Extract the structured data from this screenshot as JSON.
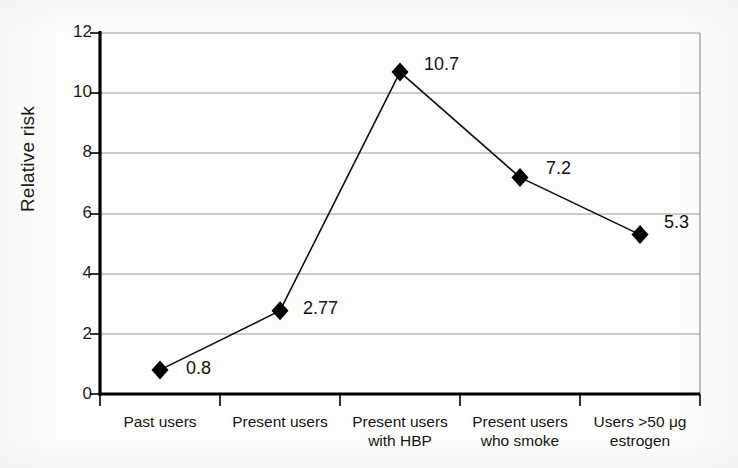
{
  "chart_data": {
    "type": "line",
    "title": "",
    "xlabel": "",
    "ylabel": "Relative risk",
    "categories": [
      "Past users",
      "Present users",
      "Present users\nwith HBP",
      "Present users\nwho smoke",
      "Users >50 μg\nestrogen"
    ],
    "category_lines": [
      [
        "Past users"
      ],
      [
        "Present users"
      ],
      [
        "Present users",
        "with HBP"
      ],
      [
        "Present users",
        "who smoke"
      ],
      [
        "Users >50 μg",
        "estrogen"
      ]
    ],
    "values": [
      0.8,
      2.77,
      10.7,
      7.2,
      5.3
    ],
    "point_labels": [
      "0.8",
      "2.77",
      "10.7",
      "7.2",
      "5.3"
    ],
    "ylim": [
      0,
      12
    ],
    "yticks": [
      0,
      2,
      4,
      6,
      8,
      10,
      12
    ],
    "ytick_labels": [
      "0",
      "2",
      "4",
      "6",
      "8",
      "10",
      "12"
    ],
    "grid": "horizontal",
    "legend": "none",
    "marker": "diamond",
    "colors": {
      "line": "#111111",
      "marker": "#000000",
      "grid": "#9a9a9a",
      "axis": "#000000",
      "text": "#151515",
      "background": "#fdfdfc"
    }
  }
}
